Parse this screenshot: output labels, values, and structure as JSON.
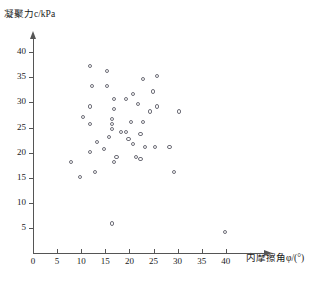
{
  "chart_data": {
    "type": "scatter",
    "title": "",
    "xlabel": "内摩擦角φ/(°)",
    "ylabel": "凝聚力c/kPa",
    "xlim": [
      0,
      42
    ],
    "ylim": [
      0,
      42
    ],
    "xticks": [
      0,
      5,
      10,
      15,
      20,
      25,
      30,
      35,
      40
    ],
    "yticks": [
      5,
      10,
      15,
      20,
      25,
      30,
      35,
      40
    ],
    "grid": false,
    "legend": null,
    "marker": "open-circle",
    "points": [
      [
        12.0,
        37.0
      ],
      [
        15.5,
        36.0
      ],
      [
        23.0,
        34.5
      ],
      [
        26.0,
        35.0
      ],
      [
        12.5,
        33.0
      ],
      [
        15.5,
        33.0
      ],
      [
        21.0,
        31.5
      ],
      [
        25.0,
        32.0
      ],
      [
        17.0,
        30.5
      ],
      [
        19.5,
        30.5
      ],
      [
        12.0,
        29.0
      ],
      [
        17.0,
        28.5
      ],
      [
        22.0,
        29.5
      ],
      [
        26.0,
        29.0
      ],
      [
        24.5,
        28.0
      ],
      [
        30.5,
        28.0
      ],
      [
        10.5,
        27.0
      ],
      [
        16.5,
        26.5
      ],
      [
        20.5,
        26.0
      ],
      [
        23.0,
        26.0
      ],
      [
        12.0,
        25.5
      ],
      [
        16.5,
        25.5
      ],
      [
        16.5,
        24.5
      ],
      [
        18.5,
        24.0
      ],
      [
        19.5,
        24.0
      ],
      [
        22.5,
        23.5
      ],
      [
        16.0,
        23.0
      ],
      [
        20.0,
        22.5
      ],
      [
        13.5,
        22.0
      ],
      [
        21.0,
        21.5
      ],
      [
        23.5,
        21.0
      ],
      [
        25.5,
        21.0
      ],
      [
        12.0,
        20.0
      ],
      [
        15.0,
        20.5
      ],
      [
        17.5,
        19.0
      ],
      [
        28.5,
        21.0
      ],
      [
        21.5,
        19.0
      ],
      [
        22.5,
        18.5
      ],
      [
        8.0,
        18.0
      ],
      [
        17.0,
        18.0
      ],
      [
        13.0,
        16.0
      ],
      [
        10.0,
        15.0
      ],
      [
        29.5,
        16.0
      ],
      [
        16.5,
        5.7
      ],
      [
        40.0,
        4.0
      ]
    ]
  }
}
